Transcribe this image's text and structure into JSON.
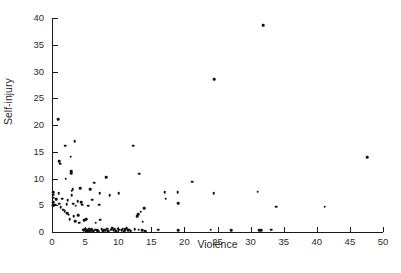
{
  "chart_data": {
    "type": "scatter",
    "title": "",
    "xlabel": "Violence",
    "ylabel": "Self-injury",
    "xlim": [
      0,
      50
    ],
    "ylim": [
      0,
      40
    ],
    "xticks": [
      0,
      5,
      10,
      15,
      20,
      25,
      30,
      35,
      40,
      45,
      50
    ],
    "yticks": [
      0,
      5,
      10,
      15,
      20,
      25,
      30,
      35,
      40
    ],
    "grid": false,
    "legend": null,
    "marker": {
      "shape": "circle",
      "color": "#111111",
      "size": 2.6
    },
    "points": [
      {
        "x": 0.2,
        "y": 7.4
      },
      {
        "x": 0.2,
        "y": 7.0
      },
      {
        "x": 0.2,
        "y": 6.4
      },
      {
        "x": 0.2,
        "y": 5.6
      },
      {
        "x": 0.2,
        "y": 5.0
      },
      {
        "x": 0.2,
        "y": 4.9
      },
      {
        "x": 0.5,
        "y": 5.1
      },
      {
        "x": 0.6,
        "y": 6.1
      },
      {
        "x": 0.9,
        "y": 21.1
      },
      {
        "x": 1.0,
        "y": 7.3
      },
      {
        "x": 1.1,
        "y": 13.2
      },
      {
        "x": 1.2,
        "y": 12.8
      },
      {
        "x": 1.1,
        "y": 5.3
      },
      {
        "x": 1.3,
        "y": 4.6
      },
      {
        "x": 1.5,
        "y": 6.2
      },
      {
        "x": 1.7,
        "y": 4.2
      },
      {
        "x": 1.9,
        "y": 3.9
      },
      {
        "x": 2.0,
        "y": 16.1
      },
      {
        "x": 2.1,
        "y": 10.0
      },
      {
        "x": 2.2,
        "y": 5.2
      },
      {
        "x": 2.3,
        "y": 3.5
      },
      {
        "x": 2.4,
        "y": 5.9
      },
      {
        "x": 2.5,
        "y": 3.2
      },
      {
        "x": 2.7,
        "y": 2.4
      },
      {
        "x": 2.8,
        "y": 14.1
      },
      {
        "x": 2.9,
        "y": 11.4
      },
      {
        "x": 2.9,
        "y": 11.0
      },
      {
        "x": 3.0,
        "y": 7.7
      },
      {
        "x": 3.0,
        "y": 6.9
      },
      {
        "x": 3.1,
        "y": 8.0
      },
      {
        "x": 3.2,
        "y": 5.3
      },
      {
        "x": 3.3,
        "y": 2.9
      },
      {
        "x": 3.4,
        "y": 17.0
      },
      {
        "x": 3.5,
        "y": 2.0
      },
      {
        "x": 3.6,
        "y": 4.9
      },
      {
        "x": 3.9,
        "y": 5.8
      },
      {
        "x": 4.0,
        "y": 3.1
      },
      {
        "x": 4.1,
        "y": 1.7
      },
      {
        "x": 4.3,
        "y": 8.2
      },
      {
        "x": 4.4,
        "y": 5.6
      },
      {
        "x": 4.6,
        "y": 5.1
      },
      {
        "x": 4.7,
        "y": 0.4
      },
      {
        "x": 4.8,
        "y": 0.3
      },
      {
        "x": 4.9,
        "y": 2.2
      },
      {
        "x": 5.0,
        "y": 0.5
      },
      {
        "x": 5.1,
        "y": 0.2
      },
      {
        "x": 5.2,
        "y": 0.3
      },
      {
        "x": 5.2,
        "y": 2.4
      },
      {
        "x": 5.3,
        "y": 0.1
      },
      {
        "x": 5.4,
        "y": 0.4
      },
      {
        "x": 5.5,
        "y": 0.2
      },
      {
        "x": 5.5,
        "y": 4.9
      },
      {
        "x": 5.6,
        "y": 0.6
      },
      {
        "x": 5.7,
        "y": 0.2
      },
      {
        "x": 5.8,
        "y": 8.0
      },
      {
        "x": 5.9,
        "y": 0.3
      },
      {
        "x": 6.0,
        "y": 0.5
      },
      {
        "x": 6.1,
        "y": 6.0
      },
      {
        "x": 6.2,
        "y": 0.2
      },
      {
        "x": 6.4,
        "y": 9.2
      },
      {
        "x": 6.5,
        "y": 0.4
      },
      {
        "x": 6.6,
        "y": 1.7
      },
      {
        "x": 6.8,
        "y": 0.3
      },
      {
        "x": 7.0,
        "y": 0.2
      },
      {
        "x": 7.1,
        "y": 5.1
      },
      {
        "x": 7.2,
        "y": 7.3
      },
      {
        "x": 7.3,
        "y": 2.3
      },
      {
        "x": 7.5,
        "y": 0.5
      },
      {
        "x": 7.7,
        "y": 0.2
      },
      {
        "x": 7.9,
        "y": 0.4
      },
      {
        "x": 8.1,
        "y": 0.3
      },
      {
        "x": 8.2,
        "y": 10.2
      },
      {
        "x": 8.3,
        "y": 0.6
      },
      {
        "x": 8.5,
        "y": 0.2
      },
      {
        "x": 8.7,
        "y": 6.9
      },
      {
        "x": 8.9,
        "y": 0.4
      },
      {
        "x": 9.1,
        "y": 0.7
      },
      {
        "x": 9.3,
        "y": 0.3
      },
      {
        "x": 9.5,
        "y": 0.5
      },
      {
        "x": 9.7,
        "y": 0.2
      },
      {
        "x": 9.9,
        "y": 0.6
      },
      {
        "x": 10.1,
        "y": 7.2
      },
      {
        "x": 10.2,
        "y": 0.4
      },
      {
        "x": 10.5,
        "y": 0.3
      },
      {
        "x": 10.7,
        "y": 0.6
      },
      {
        "x": 10.9,
        "y": 0.2
      },
      {
        "x": 11.1,
        "y": 0.5
      },
      {
        "x": 11.3,
        "y": 0.7
      },
      {
        "x": 11.5,
        "y": 0.3
      },
      {
        "x": 11.7,
        "y": 0.4
      },
      {
        "x": 11.9,
        "y": 0.2
      },
      {
        "x": 12.3,
        "y": 16.1
      },
      {
        "x": 12.5,
        "y": 0.5
      },
      {
        "x": 12.9,
        "y": 3.0
      },
      {
        "x": 13.0,
        "y": 3.3
      },
      {
        "x": 13.1,
        "y": 0.4
      },
      {
        "x": 13.2,
        "y": 10.9
      },
      {
        "x": 13.4,
        "y": 3.8
      },
      {
        "x": 13.6,
        "y": 0.3
      },
      {
        "x": 13.7,
        "y": 1.9
      },
      {
        "x": 13.9,
        "y": 4.4
      },
      {
        "x": 14.1,
        "y": 0.2
      },
      {
        "x": 16.0,
        "y": 0.4
      },
      {
        "x": 17.0,
        "y": 7.4
      },
      {
        "x": 17.2,
        "y": 6.2
      },
      {
        "x": 19.0,
        "y": 7.4
      },
      {
        "x": 19.1,
        "y": 5.4
      },
      {
        "x": 19.1,
        "y": 0.3
      },
      {
        "x": 21.2,
        "y": 9.4
      },
      {
        "x": 24.0,
        "y": 0.4
      },
      {
        "x": 24.4,
        "y": 7.3
      },
      {
        "x": 24.5,
        "y": 28.6
      },
      {
        "x": 27.1,
        "y": 0.3
      },
      {
        "x": 31.1,
        "y": 7.5
      },
      {
        "x": 31.3,
        "y": 0.3
      },
      {
        "x": 31.6,
        "y": 0.3
      },
      {
        "x": 31.9,
        "y": 38.7
      },
      {
        "x": 33.1,
        "y": 0.4
      },
      {
        "x": 33.9,
        "y": 4.7
      },
      {
        "x": 41.2,
        "y": 4.7
      },
      {
        "x": 47.6,
        "y": 14.0
      }
    ]
  }
}
